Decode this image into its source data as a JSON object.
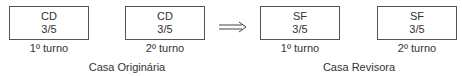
{
  "groups": [
    {
      "label": "Casa Originária",
      "boxes": [
        {
          "code": "CD",
          "ratio": "3/5",
          "turno": "1º turno"
        },
        {
          "code": "CD",
          "ratio": "3/5",
          "turno": "2º turno"
        }
      ]
    },
    {
      "label": "Casa Revisora",
      "boxes": [
        {
          "code": "SF",
          "ratio": "3/5",
          "turno": "1º turno"
        },
        {
          "code": "SF",
          "ratio": "3/5",
          "turno": "2º turno"
        }
      ]
    }
  ],
  "arrow": "implies-arrow"
}
